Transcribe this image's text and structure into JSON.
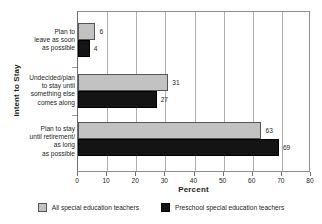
{
  "chart_data": {
    "type": "bar",
    "orientation": "horizontal",
    "title": "",
    "xlabel": "Percent",
    "ylabel": "Intent to Stay",
    "xlim": [
      0,
      80
    ],
    "xticks": [
      0,
      10,
      20,
      30,
      40,
      50,
      60,
      70,
      80
    ],
    "grid": true,
    "legend_position": "bottom",
    "categories": [
      "Plan to leave as soon as possible",
      "Undecided/plan to stay until something else comes along",
      "Plan to stay until retirement/as long as possible"
    ],
    "category_lines": [
      [
        "Plan to",
        "leave as soon",
        "as possible"
      ],
      [
        "Undecided/plan",
        "to stay until",
        "something else",
        "comes along"
      ],
      [
        "Plan to stay",
        "until retirement/",
        "as long",
        "as possible"
      ]
    ],
    "series": [
      {
        "name": "All special education teachers",
        "color": "#c2c2c2",
        "values": [
          6,
          31,
          63
        ]
      },
      {
        "name": "Preschool special education teachers",
        "color": "#141414",
        "values": [
          4,
          27,
          69
        ]
      }
    ]
  },
  "axes": {
    "y_title": "Intent to Stay",
    "x_title": "Percent",
    "x_tick_labels": [
      "0",
      "10",
      "20",
      "30",
      "40",
      "50",
      "60",
      "70",
      "80"
    ]
  },
  "legend": {
    "items": [
      {
        "label": "All special education teachers",
        "swatch": "gray"
      },
      {
        "label": "Preschool special education teachers",
        "swatch": "black"
      }
    ]
  }
}
